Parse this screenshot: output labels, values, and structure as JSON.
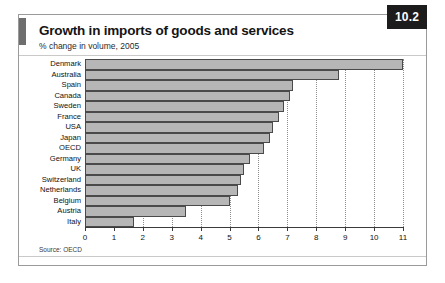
{
  "figure": {
    "badge": "10.2",
    "title": "Growth in imports of goods and services",
    "subtitle": "% change in volume, 2005",
    "source": "Source: OECD"
  },
  "chart_data": {
    "type": "bar",
    "orientation": "horizontal",
    "title": "Growth in imports of goods and services",
    "subtitle": "% change in volume, 2005",
    "xlabel": "",
    "ylabel": "",
    "xlim": [
      0,
      11
    ],
    "xticks": [
      0,
      1,
      2,
      3,
      4,
      5,
      6,
      7,
      8,
      9,
      10,
      11
    ],
    "xtick_labels": [
      "0",
      "1",
      "2",
      "3",
      "4",
      "5",
      "6",
      "7",
      "8",
      "9",
      "10",
      "11"
    ],
    "grid": "vertical-dotted",
    "legend": "none",
    "bar_color": "#b6b6b6",
    "bar_edge_color": "#4a4a4a",
    "categories": [
      "Denmark",
      "Australia",
      "Spain",
      "Canada",
      "Sweden",
      "France",
      "USA",
      "Japan",
      "OECD",
      "Germany",
      "UK",
      "Switzerland",
      "Netherlands",
      "Belgium",
      "Austria",
      "Italy"
    ],
    "values": [
      11.0,
      8.8,
      7.2,
      7.1,
      6.9,
      6.7,
      6.5,
      6.4,
      6.2,
      5.7,
      5.5,
      5.4,
      5.3,
      5.0,
      3.5,
      1.7
    ],
    "source": "Source: OECD"
  }
}
